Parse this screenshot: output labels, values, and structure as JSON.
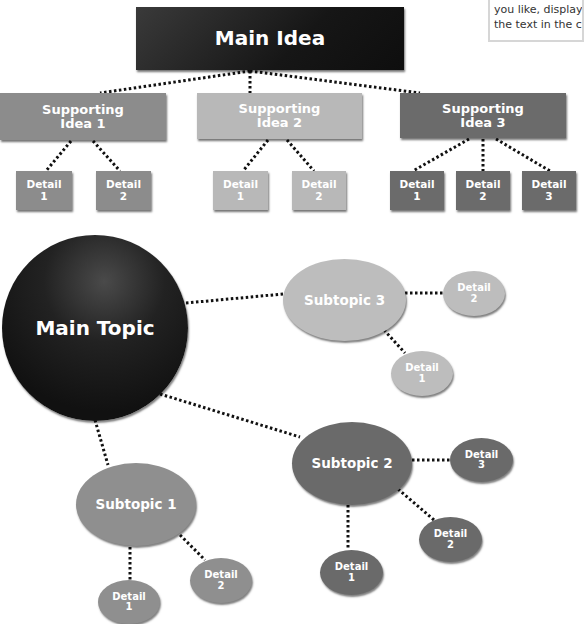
{
  "note": {
    "lines": [
      "you like, display",
      "the text in the c"
    ]
  },
  "hierarchy_chart": {
    "main": {
      "lines": [
        "Main Idea"
      ],
      "color": "#1c1c1c"
    },
    "supporting": [
      {
        "lines": [
          "Supporting",
          "Idea 1"
        ],
        "color": "#8c8c8c",
        "details": [
          {
            "lines": [
              "Detail",
              "1"
            ]
          },
          {
            "lines": [
              "Detail",
              "2"
            ]
          }
        ]
      },
      {
        "lines": [
          "Supporting",
          "Idea 2"
        ],
        "color": "#b8b8b8",
        "details": [
          {
            "lines": [
              "Detail",
              "1"
            ]
          },
          {
            "lines": [
              "Detail",
              "2"
            ]
          }
        ]
      },
      {
        "lines": [
          "Supporting",
          "Idea 3"
        ],
        "color": "#6b6b6b",
        "details": [
          {
            "lines": [
              "Detail",
              "1"
            ]
          },
          {
            "lines": [
              "Detail",
              "2"
            ]
          },
          {
            "lines": [
              "Detail",
              "3"
            ]
          }
        ]
      }
    ]
  },
  "web_diagram": {
    "main": {
      "lines": [
        "Main Topic"
      ],
      "color": "#161616"
    },
    "subtopics": [
      {
        "lines": [
          "Subtopic 1"
        ],
        "color": "#8f8f8f",
        "details": [
          {
            "lines": [
              "Detail",
              "1"
            ]
          },
          {
            "lines": [
              "Detail",
              "2"
            ]
          }
        ]
      },
      {
        "lines": [
          "Subtopic 2"
        ],
        "color": "#6a6a6a",
        "details": [
          {
            "lines": [
              "Detail",
              "1"
            ]
          },
          {
            "lines": [
              "Detail",
              "2"
            ]
          },
          {
            "lines": [
              "Detail",
              "3"
            ]
          }
        ]
      },
      {
        "lines": [
          "Subtopic 3"
        ],
        "color": "#bdbdbd",
        "details": [
          {
            "lines": [
              "Detail",
              "1"
            ]
          },
          {
            "lines": [
              "Detail",
              "2"
            ]
          }
        ]
      }
    ]
  }
}
